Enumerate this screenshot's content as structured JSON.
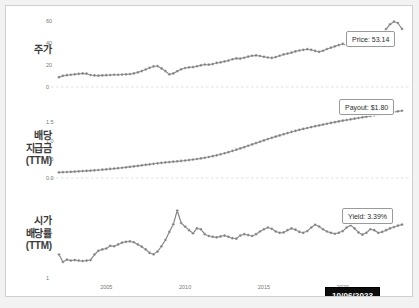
{
  "meta": {
    "colors": {
      "series": "#808080",
      "marker": "#7a7a7a",
      "gridline": "#d9d9d9",
      "tick_text": "#777777",
      "frame": "#cfcfcf",
      "tooltip_bg": "#0d0d0d",
      "tooltip_text": "#ffffff",
      "page_bg": "#f2f2f2",
      "plot_bg": "#ffffff"
    }
  },
  "panels": {
    "price": {
      "row_label_lines": [
        "주가"
      ],
      "y_ticks": [
        "60",
        "40",
        "20",
        "0"
      ],
      "callout": "Price: 53.14"
    },
    "payout": {
      "row_label_lines": [
        "배당",
        "지급금",
        "(TTM)"
      ],
      "y_ticks": [
        "1.5",
        "1.0",
        "0.5",
        "0.0"
      ],
      "callout": "Payout: $1.80"
    },
    "yield": {
      "row_label_lines": [
        "시가",
        "배당률",
        "(TTM)"
      ],
      "y_ticks": [
        "3",
        "1"
      ],
      "callout": "Yield: 3.39%"
    }
  },
  "x_axis": {
    "ticks": [
      "2005",
      "2010",
      "2015",
      "2020"
    ]
  },
  "tooltip": {
    "date": "10/06/2023"
  },
  "chart_data": {
    "type": "line",
    "title": "",
    "xlabel": "",
    "grid": true,
    "legend": "none",
    "x": [
      2002.0,
      2002.25,
      2002.5,
      2002.75,
      2003.0,
      2003.25,
      2003.5,
      2003.75,
      2004.0,
      2004.25,
      2004.5,
      2004.75,
      2005.0,
      2005.25,
      2005.5,
      2005.75,
      2006.0,
      2006.25,
      2006.5,
      2006.75,
      2007.0,
      2007.25,
      2007.5,
      2007.75,
      2008.0,
      2008.25,
      2008.5,
      2008.75,
      2009.0,
      2009.25,
      2009.5,
      2009.75,
      2010.0,
      2010.25,
      2010.5,
      2010.75,
      2011.0,
      2011.25,
      2011.5,
      2011.75,
      2012.0,
      2012.25,
      2012.5,
      2012.75,
      2013.0,
      2013.25,
      2013.5,
      2013.75,
      2014.0,
      2014.25,
      2014.5,
      2014.75,
      2015.0,
      2015.25,
      2015.5,
      2015.75,
      2016.0,
      2016.25,
      2016.5,
      2016.75,
      2017.0,
      2017.25,
      2017.5,
      2017.75,
      2018.0,
      2018.25,
      2018.5,
      2018.75,
      2019.0,
      2019.25,
      2019.5,
      2019.75,
      2020.0,
      2020.25,
      2020.5,
      2020.75,
      2021.0,
      2021.25,
      2021.5,
      2021.75,
      2022.0,
      2022.25,
      2022.5,
      2022.75,
      2023.0,
      2023.25,
      2023.5,
      2023.76
    ],
    "series": [
      {
        "name": "Price",
        "ylabel": "주가",
        "ylim": [
          0,
          65
        ],
        "units": "USD",
        "last_value": 53.14,
        "values": [
          9.0,
          10.2,
          10.8,
          11.2,
          11.6,
          12.0,
          12.4,
          12.2,
          11.0,
          10.6,
          10.4,
          10.6,
          10.8,
          11.0,
          11.2,
          11.2,
          11.4,
          11.6,
          11.8,
          12.4,
          13.4,
          14.6,
          16.0,
          17.6,
          18.8,
          19.2,
          17.0,
          14.6,
          11.6,
          12.4,
          14.4,
          16.2,
          17.4,
          18.0,
          18.2,
          19.0,
          19.8,
          20.6,
          20.4,
          21.0,
          22.0,
          22.6,
          23.4,
          24.2,
          25.4,
          26.2,
          26.0,
          26.8,
          27.8,
          28.6,
          29.0,
          28.4,
          27.6,
          27.0,
          26.6,
          27.4,
          28.6,
          29.8,
          30.6,
          31.4,
          32.6,
          33.4,
          34.0,
          34.6,
          34.0,
          33.0,
          32.2,
          33.2,
          34.8,
          36.0,
          37.2,
          38.4,
          39.4,
          38.2,
          37.0,
          38.6,
          41.0,
          43.4,
          43.0,
          41.2,
          42.6,
          45.6,
          49.2,
          53.0,
          57.4,
          59.8,
          58.6,
          53.14
        ]
      },
      {
        "name": "Payout (TTM)",
        "ylabel": "배당 지급금 (TTM)",
        "ylim": [
          0.0,
          1.9
        ],
        "units": "USD",
        "last_value": 1.8,
        "values": [
          0.15,
          0.155,
          0.16,
          0.165,
          0.172,
          0.178,
          0.184,
          0.19,
          0.198,
          0.206,
          0.214,
          0.222,
          0.232,
          0.242,
          0.252,
          0.262,
          0.274,
          0.286,
          0.298,
          0.31,
          0.324,
          0.338,
          0.352,
          0.366,
          0.38,
          0.394,
          0.406,
          0.416,
          0.426,
          0.436,
          0.446,
          0.456,
          0.468,
          0.48,
          0.494,
          0.508,
          0.524,
          0.542,
          0.562,
          0.584,
          0.608,
          0.634,
          0.662,
          0.692,
          0.724,
          0.758,
          0.792,
          0.826,
          0.862,
          0.898,
          0.934,
          0.97,
          1.006,
          1.042,
          1.076,
          1.108,
          1.14,
          1.172,
          1.202,
          1.232,
          1.26,
          1.288,
          1.314,
          1.338,
          1.362,
          1.386,
          1.408,
          1.43,
          1.452,
          1.474,
          1.494,
          1.514,
          1.534,
          1.552,
          1.57,
          1.588,
          1.606,
          1.624,
          1.642,
          1.66,
          1.678,
          1.696,
          1.714,
          1.732,
          1.75,
          1.768,
          1.784,
          1.8
        ]
      },
      {
        "name": "Yield (TTM)",
        "ylabel": "시가 배당률 (TTM)",
        "ylim": [
          1.0,
          4.4
        ],
        "units": "%",
        "last_value": 3.39,
        "values": [
          2.05,
          1.72,
          1.82,
          1.78,
          1.8,
          1.78,
          1.76,
          1.78,
          1.8,
          2.05,
          2.22,
          2.28,
          2.32,
          2.44,
          2.42,
          2.5,
          2.58,
          2.62,
          2.64,
          2.6,
          2.5,
          2.4,
          2.28,
          2.12,
          2.06,
          2.18,
          2.42,
          2.7,
          3.06,
          3.4,
          4.02,
          3.46,
          3.3,
          3.14,
          3.0,
          3.22,
          3.18,
          2.96,
          2.88,
          2.84,
          2.82,
          2.86,
          2.9,
          2.84,
          2.78,
          2.76,
          2.9,
          2.96,
          2.92,
          2.88,
          2.96,
          3.08,
          3.18,
          3.26,
          3.2,
          3.08,
          3.02,
          3.04,
          3.14,
          3.22,
          3.16,
          3.06,
          3.02,
          3.1,
          3.26,
          3.38,
          3.3,
          3.18,
          3.08,
          3.02,
          2.98,
          3.02,
          3.1,
          3.26,
          3.36,
          3.22,
          3.04,
          2.94,
          3.02,
          3.18,
          3.14,
          3.02,
          3.06,
          3.14,
          3.22,
          3.28,
          3.34,
          3.39
        ]
      }
    ]
  }
}
